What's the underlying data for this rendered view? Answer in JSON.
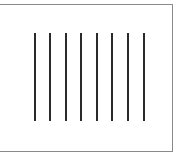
{
  "diagram": {
    "line_count": 8,
    "line_color": "#2a2a2a",
    "border_color": "#8a8a8a",
    "lines": [
      {
        "x": 35,
        "y1": 33,
        "y2": 121
      },
      {
        "x": 50,
        "y1": 33,
        "y2": 121
      },
      {
        "x": 66,
        "y1": 33,
        "y2": 121
      },
      {
        "x": 81,
        "y1": 33,
        "y2": 121
      },
      {
        "x": 97,
        "y1": 33,
        "y2": 121
      },
      {
        "x": 112,
        "y1": 33,
        "y2": 121
      },
      {
        "x": 128,
        "y1": 33,
        "y2": 121
      },
      {
        "x": 144,
        "y1": 33,
        "y2": 121
      }
    ]
  }
}
